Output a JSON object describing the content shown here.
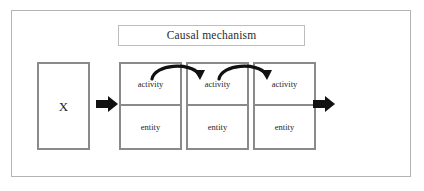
{
  "diagram": {
    "title_box": {
      "label": "Causal mechanism"
    },
    "cause": {
      "label": "X"
    },
    "effect": {
      "label": "Y"
    },
    "mechanism_parts": [
      {
        "activity": "activity",
        "entity": "entity"
      },
      {
        "activity": "activity",
        "entity": "entity"
      },
      {
        "activity": "activity",
        "entity": "entity"
      }
    ],
    "connectors": {
      "block_arrow_in": "block-arrow-right",
      "block_arrow_out": "block-arrow-right",
      "curved_arrows": [
        "curved-arrow-right",
        "curved-arrow-right"
      ]
    },
    "colors": {
      "box_border": "#8a8a8a",
      "frame_border": "#b3b3b3",
      "title_border": "#bdbdbd",
      "arrow_fill": "#111111",
      "text": "#1d1d1d",
      "background": "#ffffff"
    }
  }
}
